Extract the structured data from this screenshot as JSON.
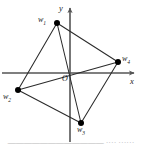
{
  "figure": {
    "name": "coordinate-plane-quadrilateral",
    "background_color": "#ffffff",
    "stroke_color": "#2b2b2b",
    "axis_color": "#555555",
    "vertex_fill": "#000000"
  },
  "axes": {
    "x_label": "x",
    "y_label": "y",
    "origin_label": "O",
    "origin_px": {
      "x": 70,
      "y": 73
    },
    "x_axis": {
      "x1": 2,
      "y1": 73,
      "x2": 136,
      "y2": 73
    },
    "y_axis": {
      "x1": 70,
      "y1": 142,
      "x2": 70,
      "y2": 6
    }
  },
  "vertices": [
    {
      "id": "w1",
      "label": "w",
      "subscript": "1",
      "px": {
        "x": 57,
        "y": 23
      }
    },
    {
      "id": "w2",
      "label": "w",
      "subscript": "2",
      "px": {
        "x": 18,
        "y": 90
      }
    },
    {
      "id": "w3",
      "label": "w",
      "subscript": "3",
      "px": {
        "x": 81,
        "y": 123
      }
    },
    {
      "id": "w4",
      "label": "w",
      "subscript": "4",
      "px": {
        "x": 118,
        "y": 62
      }
    }
  ],
  "edges": [
    {
      "from": "w1",
      "to": "w2",
      "kind": "side"
    },
    {
      "from": "w2",
      "to": "w3",
      "kind": "side"
    },
    {
      "from": "w3",
      "to": "w4",
      "kind": "side"
    },
    {
      "from": "w4",
      "to": "w1",
      "kind": "side"
    },
    {
      "from": "w1",
      "to": "w3",
      "kind": "diagonal"
    },
    {
      "from": "w2",
      "to": "w4",
      "kind": "diagonal"
    }
  ],
  "caption": {
    "text": "————————————      ····   ······"
  }
}
